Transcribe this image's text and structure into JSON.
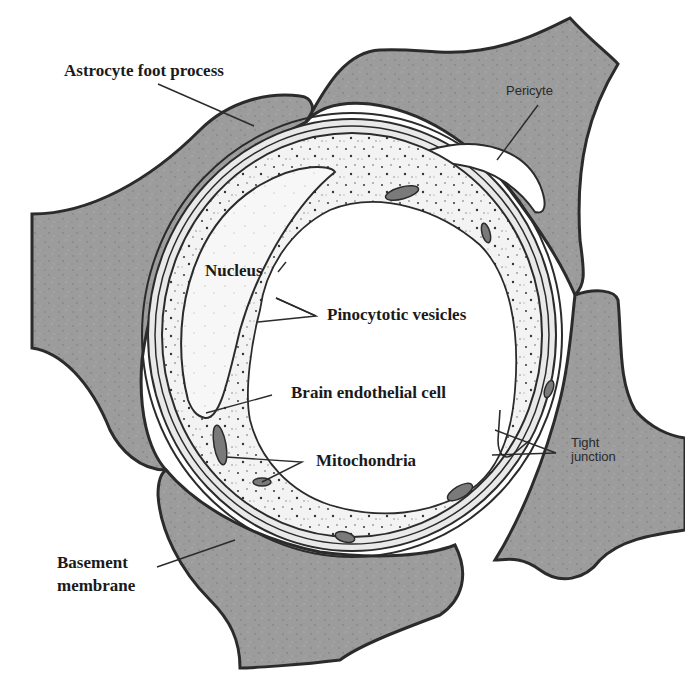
{
  "diagram": {
    "colors": {
      "background": "#ffffff",
      "astrocyte_fill": "#9c9c9c",
      "membrane_stroke": "#2b2b2b",
      "endothelium_fill": "#f1f1f1",
      "lumen_fill": "#ffffff",
      "text": "#1a1a1a"
    },
    "labels": {
      "astrocyte_foot_process": "Astrocyte foot process",
      "pericyte": "Pericyte",
      "nucleus": "Nucleus",
      "pinocytotic_vesicles": "Pinocytotic vesicles",
      "brain_endothelial_cell": "Brain endothelial cell",
      "mitochondria": "Mitochondria",
      "tight_junction_line1": "Tight",
      "tight_junction_line2": "junction",
      "basement_membrane_line1": "Basement",
      "basement_membrane_line2": "membrane"
    }
  }
}
